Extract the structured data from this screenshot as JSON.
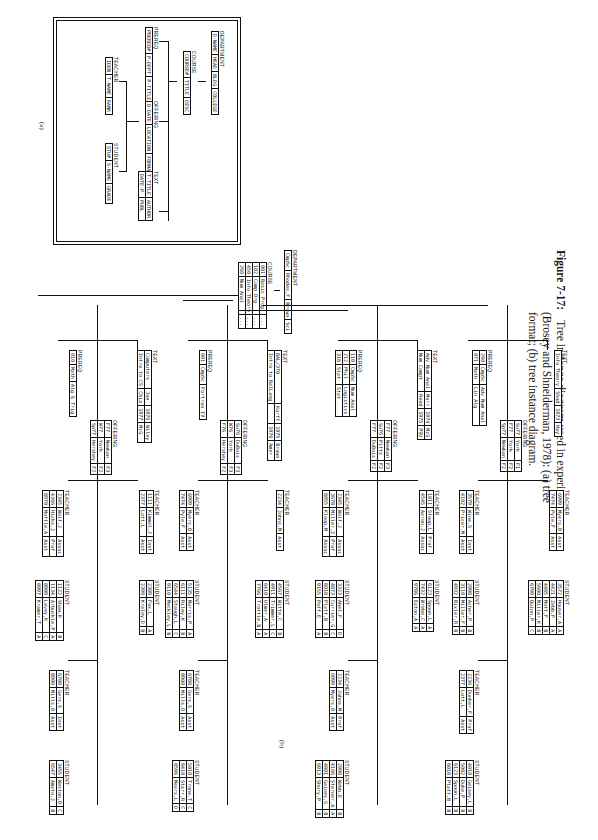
{
  "caption": {
    "figure_label": "Figure 7-17:",
    "line1": "Tree instance diagram used in experiment",
    "line2": "(Brosey and Shneiderman, 1978): (a) tree",
    "line3": "format; (b) tree instance diagram."
  },
  "schema": {
    "sublabel": "(a)",
    "department": {
      "label": "DEPARTMENT",
      "fields": [
        "D-NAME",
        "HEAD",
        "BLDG",
        "COLLEGE"
      ]
    },
    "course": {
      "label": "COURSE",
      "fields": [
        "COURSE#",
        "TITLE",
        "DESC"
      ]
    },
    "prereq": {
      "label": "PREREQ",
      "fields": [
        "PREREQ#",
        "P-DEPT",
        "P-TITLE"
      ]
    },
    "offering": {
      "label": "OFFERING",
      "fields": [
        "O-DATE",
        "LOCATION",
        "FORMAT"
      ]
    },
    "text": {
      "label": "TEXT",
      "fields": [
        "T-TITLE",
        "AUTHOR",
        "DATE-P",
        "PUBL"
      ]
    },
    "teacher": {
      "label": "TEACHER",
      "fields": [
        "IDEN",
        "T-NAME",
        "RANK"
      ]
    },
    "student": {
      "label": "STUDENT",
      "fields": [
        "STU#",
        "S-NAME",
        "GRADE"
      ]
    }
  },
  "instance": {
    "sublabel": "(b)",
    "department": {
      "label": "DEPARTMENT",
      "values": [
        "CmpSc",
        "Rhodes,F",
        "Brown",
        "Sci"
      ]
    },
    "course": {
      "label": "COURSE",
      "rows": [
        [
          "001",
          "Basic Prog",
          "..."
        ],
        [
          "102",
          "Comp Org",
          "..."
        ],
        [
          "450",
          "Info Theory",
          "..."
        ],
        [
          "260",
          "Num Anal",
          "..."
        ]
      ]
    },
    "branches": [
      {
        "prereq": {
          "label": "PREREQ",
          "rows": [
            [
              "010",
              "Math",
              "Alg & Trig"
            ]
          ]
        },
        "text": {
          "label": "TEXT",
          "rows": [
            [
              "Computers",
              "Joe",
              "1976",
              "Wiley"
            ],
            [
              "Intro to CS",
              "Chia",
              "1977",
              "McG"
            ]
          ]
        },
        "offering": {
          "label": "OFFERING",
          "rows": [
            [
              "F77",
              "Newkan",
              "F3"
            ],
            [
              "W77",
              "York",
              "F2"
            ],
            [
              "Sp77",
              "Hershey",
              "F2"
            ]
          ]
        },
        "groups": [
          {
            "teacher": {
              "label": "TEACHER",
              "rows": [
                [
                  "2345",
                  "Wolf,J",
                  "Assoc"
                ],
                [
                  "4366",
                  "Hicks,J",
                  "Prof"
                ],
                [
                  "8970",
                  "Mottle,A",
                  "Asst"
                ]
              ]
            },
            "student": {
              "label": "STUDENT",
              "rows": [
                [
                  "1122",
                  "Shaw,K",
                  "B"
                ],
                [
                  "1134",
                  "Arbuckle,P",
                  "A"
                ],
                [
                  "8909",
                  "Levey,K",
                  "C"
                ],
                [
                  "8997",
                  "Kramer,T",
                  "A"
                ]
              ]
            }
          },
          {
            "teacher": {
              "label": "TEACHER",
              "rows": [
                [
                  "1111",
                  "Kimmel,J",
                  "Inst"
                ],
                [
                  "2377",
                  "Lott,L",
                  "Asst"
                ]
              ]
            },
            "student": {
              "label": "STUDENT",
              "rows": [
                [
                  "2389",
                  "Fox,L",
                  "A"
                ],
                [
                  "2390",
                  "Kraley,D",
                  "B"
                ]
              ]
            }
          },
          {
            "teacher": {
              "label": "TEACHER",
              "rows": [
                [
                  "6788",
                  "Gers,S",
                  "Inst"
                ],
                [
                  "8900",
                  "Mills,O",
                  "Asst"
                ]
              ]
            },
            "student": {
              "label": "STUDENT",
              "rows": [
                [
                  "3455",
                  "Weston,O",
                  "C"
                ],
                [
                  "6547",
                  "Amato,J",
                  "B"
                ]
              ]
            }
          }
        ]
      },
      {
        "prereq": {
          "label": "PREREQ",
          "rows": [
            [
              "001",
              "CmpSc",
              "Fortran IV"
            ]
          ]
        },
        "text": {
          "label": "TEXT",
          "rows": [
            [
              "BAL/370",
              "Korff",
              "1975",
              "Brown"
            ],
            [
              "Intro to BalLang",
              "",
              "1976",
              "Amer"
            ]
          ]
        },
        "offering": {
          "label": "OFFERING",
          "rows": [
            [
              "Su76",
              "DuBois",
              "F3"
            ],
            [
              "W76",
              "York",
              "F3"
            ],
            [
              "F76",
              "Hershey",
              "F2"
            ]
          ]
        },
        "groups": [
          {
            "teacher": {
              "label": "TEACHER",
              "rows": [
                [
                  "6999",
                  "Myers,O",
                  "Asst"
                ],
                [
                  "7474",
                  "Pyle,F",
                  "Asst"
                ]
              ]
            },
            "student": {
              "label": "STUDENT",
              "rows": [
                [
                  "5135",
                  "Morris,P",
                  "A"
                ],
                [
                  "6111",
                  "Riley,K",
                  "B"
                ],
                [
                  "6544",
                  "Staugh,L",
                  "C"
                ],
                [
                  "9110",
                  "Meckley,L",
                  "B"
                ]
              ]
            }
          },
          {
            "teacher": {
              "label": "TEACHER",
              "rows": [
                [
                  "2234",
                  "Johns,M",
                  "Asst"
                ]
              ]
            },
            "student": {
              "label": "STUDENT",
              "rows": [
                [
                  "4567",
                  "Witte,C",
                  "B"
                ],
                [
                  "4911",
                  "Trimmer,L",
                  "C"
                ],
                [
                  "6410",
                  "Ulmer,A",
                  "A"
                ],
                [
                  "7766",
                  "Trottle,B",
                  "A"
                ]
              ]
            }
          },
          {
            "teacher": {
              "label": "TEACHER",
              "rows": [
                [
                  "6788",
                  "Gers,S",
                  "Asst"
                ],
                [
                  "8900",
                  "Mills,O",
                  "Asst"
                ]
              ]
            },
            "student": {
              "label": "STUDENT",
              "rows": [
                [
                  "5010",
                  "Trone,T",
                  "C"
                ],
                [
                  "8410",
                  "Starr,R",
                  "C"
                ],
                [
                  "8596",
                  "Mears,L",
                  "D"
                ]
              ]
            }
          }
        ]
      },
      {
        "prereq": {
          "label": "PREREQ",
          "rows": [
            [
              "110",
              "CmpSc",
              "Num Anal"
            ],
            [
              "212",
              "Phil",
              "Logistics"
            ],
            [
              "318",
              "Stat",
              "Stat"
            ]
          ]
        },
        "text": {
          "label": "TEXT",
          "rows": [
            [
              "Adv Num Anal",
              "Morr",
              "1974",
              "McG"
            ],
            [
              "Num Compt",
              "Reed",
              "1975",
              "PSU"
            ]
          ]
        },
        "offering": {
          "label": "OFFERING",
          "rows": [
            [
              "F77",
              "Newkan",
              "F3"
            ],
            [
              "Su76",
              "Pitts",
              "F2"
            ],
            [
              "F77",
              "DuBois",
              "F2"
            ]
          ]
        },
        "groups": [
          {
            "teacher": {
              "label": "TEACHER",
              "rows": [
                [
                  "2345",
                  "Wolf,J",
                  "Assoc"
                ],
                [
                  "3678",
                  "Miller,Z",
                  "Prof"
                ],
                [
                  "8855",
                  "Kloop,M",
                  "Assoc"
                ]
              ]
            },
            "student": {
              "label": "STUDENT",
              "rows": [
                [
                  "3323",
                  "Abel,F",
                  "D"
                ],
                [
                  "4873",
                  "Currier,G",
                  "C"
                ],
                [
                  "8018",
                  "Platt,B",
                  "B"
                ],
                [
                  "9155",
                  "Poff,E",
                  "A"
                ]
              ]
            }
          },
          {
            "teacher": {
              "label": "TEACHER",
              "rows": [
                [
                  "1011",
                  "Stoop,L",
                  "Prof"
                ],
                [
                  "4545",
                  "Aaron,J",
                  "Assoc"
                ]
              ]
            },
            "student": {
              "label": "STUDENT",
              "rows": [
                [
                  "6123",
                  "Spoon,L",
                  "A"
                ],
                [
                  "7432",
                  "Wrebe,C",
                  "A"
                ],
                [
                  "9786",
                  "Eaton,A",
                  "A"
                ]
              ]
            }
          },
          {
            "teacher": {
              "label": "TEACHER",
              "rows": [
                [
                  "2234",
                  "Johns,M",
                  "Prof"
                ],
                [
                  "6999",
                  "Myers,O",
                  "Asst"
                ]
              ]
            },
            "student": {
              "label": "STUDENT",
              "rows": [
                [
                  "2998",
                  "Webb,E",
                  "B"
                ],
                [
                  "4166",
                  "Sterner,A",
                  "A"
                ],
                [
                  "4801",
                  "Gaines,G",
                  "B"
                ],
                [
                  "6913",
                  "Shory,P",
                  "B"
                ]
              ]
            }
          }
        ]
      },
      {
        "prereq": {
          "label": "PREREQ",
          "rows": [
            [
              "260",
              "CmpSc",
              "Adv Num Anal"
            ],
            [
              "071",
              "Math",
              "Lin Alg"
            ]
          ]
        },
        "text": {
          "label": "TEXT",
          "rows": [
            [
              "Info Theory",
              "Shod",
              "1973",
              "Hay"
            ]
          ]
        },
        "offering": {
          "label": "OFFERING",
          "rows": [
            [
              "Su77",
              "York",
              "F1"
            ],
            [
              "F77",
              "York",
              "F2"
            ],
            [
              "Sp77",
              "Newkan",
              "F2"
            ]
          ]
        },
        "groups": [
          {
            "teacher": {
              "label": "TEACHER",
              "rows": [
                [
                  "3579",
                  "Wine,S",
                  "Inst"
                ],
                [
                  "4102",
                  "Pricer,M",
                  "Asst"
                ]
              ]
            },
            "student": {
              "label": "STUDENT",
              "rows": [
                [
                  "2998",
                  "Acher,P",
                  "B"
                ],
                [
                  "3110",
                  "Miller,F",
                  "B"
                ],
                [
                  "4932",
                  "Bixler,R",
                  "B"
                ]
              ]
            }
          },
          {
            "teacher": {
              "label": "TEACHER",
              "rows": [
                [
                  "6999",
                  "Myers,O",
                  "Asst"
                ],
                [
                  "7474",
                  "Pyle,F",
                  "Asst"
                ]
              ]
            },
            "student": {
              "label": "STUDENT",
              "rows": [
                [
                  "3572",
                  "Houser,A",
                  "A"
                ],
                [
                  "4421",
                  "Zebb,F",
                  "A"
                ],
                [
                  "4485",
                  "Mott,F",
                  "B"
                ],
                [
                  "5600",
                  "Miller,K",
                  "B"
                ],
                [
                  "6799",
                  "Quinn,P",
                  "C"
                ]
              ]
            }
          },
          {
            "teacher": {
              "label": "TEACHER",
              "rows": [
                [
                  "2236",
                  "Dunker,F",
                  "Prof"
                ],
                [
                  "2377",
                  "Lott,L",
                  "Asst"
                ]
              ]
            },
            "student": {
              "label": "STUDENT",
              "rows": [
                [
                  "4010",
                  "Geisey,L",
                  "B"
                ],
                [
                  "5002",
                  "Duke,P",
                  "B"
                ],
                [
                  "6123",
                  "Spoon,L",
                  "B"
                ],
                [
                  "8018",
                  "Platt,B",
                  "B"
                ]
              ]
            }
          }
        ]
      }
    ]
  }
}
